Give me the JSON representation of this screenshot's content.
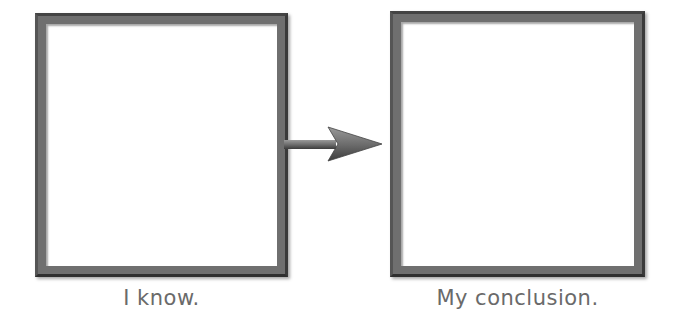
{
  "diagram": {
    "type": "flow",
    "nodes": [
      {
        "id": "left",
        "label": "I know.",
        "content": ""
      },
      {
        "id": "right",
        "label": "My conclusion.",
        "content": ""
      }
    ],
    "edges": [
      {
        "from": "left",
        "to": "right"
      }
    ]
  },
  "colors": {
    "border": "#6f6f6f",
    "label": "#6a6a6a",
    "arrow": "#707070"
  }
}
